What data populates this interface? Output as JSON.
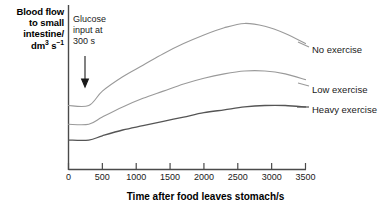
{
  "chart_data": {
    "type": "line",
    "title": "",
    "xlabel": "Time after food leaves stomach/s",
    "ylabel_lines": [
      "Blood flow",
      "to small",
      "intestine/",
      "dm3 s-1"
    ],
    "ylabel_plain": "Blood flow to small intestine/ dm³ s⁻¹",
    "xlim": [
      0,
      3500
    ],
    "xticks": [
      0,
      500,
      1000,
      1500,
      2000,
      2500,
      3000,
      3500
    ],
    "xtick_labels": [
      "0",
      "500",
      "1000",
      "1500",
      "2000",
      "2500",
      "3000",
      "3500"
    ],
    "yticks": [],
    "ytick_labels": [],
    "grid": false,
    "legend_position": "right-inline",
    "annotations": [
      {
        "name": "glucose-input-annotation",
        "text": "Glucose input at 300 s",
        "text_lines": [
          "Glucose",
          "input at",
          "300 s"
        ],
        "arrow": "down",
        "points_to_x": 300
      }
    ],
    "series": [
      {
        "name": "No exercise",
        "color": "#9a9a9a",
        "x": [
          0,
          300,
          500,
          800,
          1100,
          1400,
          1700,
          2000,
          2300,
          2600,
          2900,
          3200,
          3500
        ],
        "y": [
          0.42,
          0.42,
          0.52,
          0.62,
          0.7,
          0.78,
          0.85,
          0.91,
          0.96,
          0.99,
          0.97,
          0.92,
          0.85
        ]
      },
      {
        "name": "Low exercise",
        "color": "#9a9a9a",
        "x": [
          0,
          300,
          500,
          800,
          1100,
          1400,
          1700,
          2000,
          2300,
          2600,
          2900,
          3200,
          3500
        ],
        "y": [
          0.29,
          0.29,
          0.34,
          0.41,
          0.47,
          0.52,
          0.57,
          0.61,
          0.64,
          0.66,
          0.66,
          0.64,
          0.6
        ]
      },
      {
        "name": "Heavy exercise",
        "color": "#555555",
        "x": [
          0,
          300,
          500,
          800,
          1100,
          1400,
          1700,
          2000,
          2300,
          2600,
          2900,
          3200,
          3500
        ],
        "y": [
          0.18,
          0.18,
          0.21,
          0.25,
          0.28,
          0.31,
          0.34,
          0.37,
          0.39,
          0.41,
          0.42,
          0.42,
          0.41
        ]
      }
    ]
  },
  "labels": {
    "no_exercise": "No exercise",
    "low_exercise": "Low exercise",
    "heavy_exercise": "Heavy exercise",
    "annotation_l1": "Glucose",
    "annotation_l2": "input at",
    "annotation_l3": "300 s",
    "ylabel_l1": "Blood flow",
    "ylabel_l2": "to small",
    "ylabel_l3": "intestine/",
    "ylabel_l4_base": "dm",
    "ylabel_l4_sup1": "3",
    "ylabel_l4_mid": " s",
    "ylabel_l4_sup2": "−1",
    "xtitle": "Time after food leaves stomach/s"
  }
}
